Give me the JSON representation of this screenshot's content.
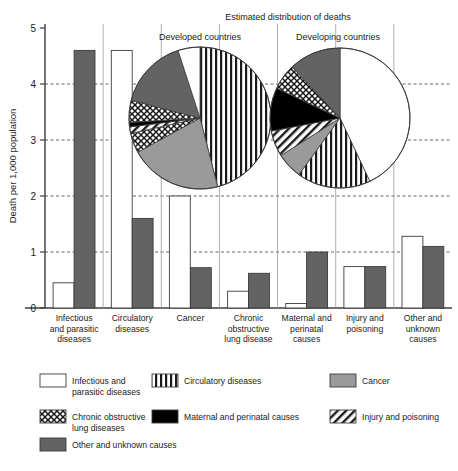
{
  "chart_data": {
    "type": "bar",
    "title": "Estimated distribution of deaths",
    "xlabel": "",
    "ylabel": "Death per 1,000 population",
    "ylim": [
      0,
      5
    ],
    "yticks": [
      "0",
      "1",
      "2",
      "3",
      "4",
      "5"
    ],
    "grid": true,
    "categories": [
      "Infectious and parasitic diseases",
      "Circulatory diseases",
      "Cancer",
      "Chronic obstructive lung disease",
      "Maternal and perinatal causes",
      "Injury and poisoning",
      "Other and unknown causes"
    ],
    "category_lines": [
      [
        "Infectious",
        "and parasitic",
        "diseases"
      ],
      [
        "Circulatory",
        "diseases"
      ],
      [
        "Cancer"
      ],
      [
        "Chronic",
        "obstructive",
        "lung disease"
      ],
      [
        "Maternal and",
        "perinatal",
        "causes"
      ],
      [
        "Injury and",
        "poisoning"
      ],
      [
        "Other and",
        "unknown",
        "causes"
      ]
    ],
    "series": [
      {
        "name": "Developed countries",
        "fill": "white",
        "values": [
          0.45,
          4.6,
          2.0,
          0.3,
          0.08,
          0.74,
          1.28
        ]
      },
      {
        "name": "Developing countries",
        "fill": "gray",
        "values": [
          4.6,
          1.6,
          0.72,
          0.62,
          1.0,
          0.74,
          1.1
        ]
      }
    ],
    "pies": [
      {
        "label": "Developed countries",
        "slices": [
          {
            "name": "Circulatory diseases",
            "percent": 46.0,
            "pattern": "vertical-stripes"
          },
          {
            "name": "Cancer",
            "percent": 21.0,
            "pattern": "gray-solid"
          },
          {
            "name": "Chronic obstructive lung diseases",
            "percent": 4.5,
            "pattern": "cross-hatch"
          },
          {
            "name": "Injury and poisoning",
            "percent": 1.5,
            "pattern": "diagonal-stripes"
          },
          {
            "name": "Maternal and perinatal causes",
            "percent": 1.0,
            "pattern": "black-solid"
          },
          {
            "name": "Chronic obstructive lung diseases",
            "percent": 5.0,
            "pattern": "cross-hatch"
          },
          {
            "name": "Other and unknown causes",
            "percent": 16.0,
            "pattern": "dark-gray-solid"
          },
          {
            "name": "Infectious and parasitic diseases",
            "percent": 5.0,
            "pattern": "white"
          }
        ]
      },
      {
        "label": "Developing countries",
        "slices": [
          {
            "name": "Infectious and parasitic diseases",
            "percent": 43.0,
            "pattern": "white"
          },
          {
            "name": "Circulatory diseases",
            "percent": 17.0,
            "pattern": "vertical-stripes"
          },
          {
            "name": "Cancer",
            "percent": 6.0,
            "pattern": "gray-solid"
          },
          {
            "name": "Injury and poisoning",
            "percent": 6.0,
            "pattern": "diagonal-stripes"
          },
          {
            "name": "Maternal and perinatal causes",
            "percent": 10.0,
            "pattern": "black-solid"
          },
          {
            "name": "Chronic obstructive lung diseases",
            "percent": 6.0,
            "pattern": "cross-hatch"
          },
          {
            "name": "Other and unknown causes",
            "percent": 12.0,
            "pattern": "dark-gray-solid"
          }
        ]
      }
    ],
    "legend": {
      "position": "bottom",
      "entries": [
        {
          "label": "Infectious and parasitic diseases",
          "lines": [
            "Infectious and",
            "parasitic diseases"
          ],
          "pattern": "white"
        },
        {
          "label": "Circulatory diseases",
          "lines": [
            "Circulatory diseases"
          ],
          "pattern": "vertical-stripes"
        },
        {
          "label": "Cancer",
          "lines": [
            "Cancer"
          ],
          "pattern": "gray-solid"
        },
        {
          "label": "Chronic obstructive lung diseases",
          "lines": [
            "Chronic obstructive",
            "lung diseases"
          ],
          "pattern": "cross-hatch"
        },
        {
          "label": "Maternal and perinatal causes",
          "lines": [
            "Maternal and perinatal causes"
          ],
          "pattern": "black-solid"
        },
        {
          "label": "Injury and poisoning",
          "lines": [
            "Injury and poisoning"
          ],
          "pattern": "diagonal-stripes"
        },
        {
          "label": "Other and unknown causes",
          "lines": [
            "Other and unknown causes"
          ],
          "pattern": "dark-gray-solid"
        }
      ]
    },
    "colors": {
      "gray_solid": "#9a9a9a",
      "dark_gray_solid": "#636363",
      "black_solid": "#000000",
      "white": "#ffffff",
      "axis": "#3c3c3c",
      "grid": "#555555"
    }
  }
}
